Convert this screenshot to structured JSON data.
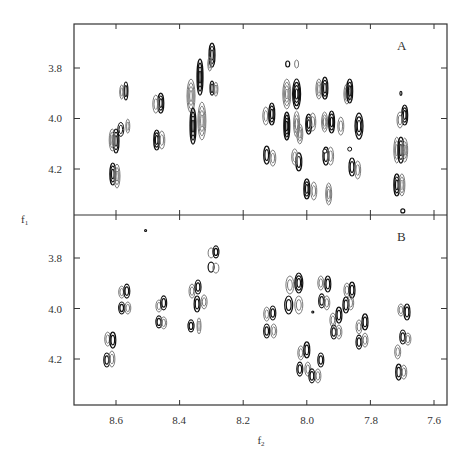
{
  "chart_data": {
    "type": "contour",
    "title": "",
    "xlabel": "f2",
    "ylabel": "f1",
    "x_ticks": [
      8.6,
      8.4,
      8.2,
      8.0,
      7.8,
      7.6
    ],
    "x_tick_labels": [
      "8.6",
      "8.4",
      "8.2",
      "8.0",
      "7.8",
      "7.6"
    ],
    "y_ticks": [
      3.8,
      4.0,
      4.2
    ],
    "y_tick_labels": [
      "3.8",
      "4.0",
      "4.2"
    ],
    "xlim": [
      8.732,
      7.559
    ],
    "ylim": [
      3.626,
      4.382
    ],
    "x_reversed": true,
    "y_reversed": true,
    "grid": false,
    "legend": "none",
    "colors": {
      "positive": "#111111",
      "negative": "#7a7a7a",
      "axis": "#333333"
    },
    "panels": [
      {
        "label": "A",
        "peaks": [
          {
            "f2": 8.569,
            "f1": 3.891,
            "w": 2,
            "h": 9,
            "c": "k"
          },
          {
            "f2": 8.582,
            "f1": 3.895,
            "w": 2,
            "h": 7,
            "c": "g"
          },
          {
            "f2": 8.585,
            "f1": 4.043,
            "w": 3,
            "h": 7,
            "c": "w"
          },
          {
            "f2": 8.6,
            "f1": 4.089,
            "w": 3,
            "h": 12,
            "c": "k"
          },
          {
            "f2": 8.612,
            "f1": 4.085,
            "w": 3,
            "h": 11,
            "c": "g"
          },
          {
            "f2": 8.563,
            "f1": 4.03,
            "w": 2,
            "h": 7,
            "c": "g"
          },
          {
            "f2": 8.61,
            "f1": 4.22,
            "w": 3,
            "h": 11,
            "c": "k"
          },
          {
            "f2": 8.597,
            "f1": 4.228,
            "w": 3,
            "h": 12,
            "c": "g"
          },
          {
            "f2": 8.459,
            "f1": 3.939,
            "w": 3,
            "h": 10,
            "c": "k"
          },
          {
            "f2": 8.475,
            "f1": 3.943,
            "w": 3,
            "h": 9,
            "c": "g"
          },
          {
            "f2": 8.472,
            "f1": 4.085,
            "w": 3,
            "h": 10,
            "c": "k"
          },
          {
            "f2": 8.456,
            "f1": 4.085,
            "w": 3,
            "h": 9,
            "c": "g"
          },
          {
            "f2": 8.298,
            "f1": 3.749,
            "w": 3,
            "h": 12,
            "c": "k"
          },
          {
            "f2": 8.305,
            "f1": 3.784,
            "w": 2,
            "h": 7,
            "c": "g"
          },
          {
            "f2": 8.298,
            "f1": 3.88,
            "w": 2,
            "h": 7,
            "c": "k"
          },
          {
            "f2": 8.286,
            "f1": 3.884,
            "w": 2,
            "h": 7,
            "c": "g"
          },
          {
            "f2": 8.364,
            "f1": 3.911,
            "w": 4,
            "h": 17,
            "c": "g"
          },
          {
            "f2": 8.336,
            "f1": 3.836,
            "w": 3,
            "h": 18,
            "c": "k"
          },
          {
            "f2": 8.358,
            "f1": 4.03,
            "w": 3,
            "h": 18,
            "c": "k"
          },
          {
            "f2": 8.33,
            "f1": 4.01,
            "w": 4,
            "h": 19,
            "c": "g"
          },
          {
            "f2": 8.06,
            "f1": 3.784,
            "w": 2,
            "h": 3,
            "c": "k"
          },
          {
            "f2": 8.032,
            "f1": 3.784,
            "w": 2,
            "h": 4,
            "c": "g"
          },
          {
            "f2": 8.063,
            "f1": 3.903,
            "w": 4,
            "h": 15,
            "c": "g"
          },
          {
            "f2": 8.032,
            "f1": 3.903,
            "w": 4,
            "h": 15,
            "c": "k"
          },
          {
            "f2": 7.962,
            "f1": 3.883,
            "w": 3,
            "h": 10,
            "c": "g"
          },
          {
            "f2": 7.943,
            "f1": 3.88,
            "w": 3,
            "h": 11,
            "c": "k"
          },
          {
            "f2": 7.874,
            "f1": 3.903,
            "w": 3,
            "h": 10,
            "c": "g"
          },
          {
            "f2": 7.865,
            "f1": 3.891,
            "w": 3,
            "h": 12,
            "c": "k"
          },
          {
            "f2": 8.129,
            "f1": 3.99,
            "w": 3,
            "h": 9,
            "c": "g"
          },
          {
            "f2": 8.11,
            "f1": 3.982,
            "w": 3,
            "h": 11,
            "c": "k"
          },
          {
            "f2": 8.063,
            "f1": 4.03,
            "w": 3,
            "h": 14,
            "c": "k"
          },
          {
            "f2": 8.032,
            "f1": 4.022,
            "w": 3,
            "h": 13,
            "c": "g"
          },
          {
            "f2": 8.022,
            "f1": 4.061,
            "w": 3,
            "h": 10,
            "c": "g"
          },
          {
            "f2": 7.994,
            "f1": 4.022,
            "w": 3,
            "h": 10,
            "c": "k"
          },
          {
            "f2": 7.981,
            "f1": 4.014,
            "w": 3,
            "h": 9,
            "c": "g"
          },
          {
            "f2": 7.944,
            "f1": 4.014,
            "w": 3,
            "h": 10,
            "c": "g"
          },
          {
            "f2": 7.922,
            "f1": 4.014,
            "w": 3,
            "h": 11,
            "c": "k"
          },
          {
            "f2": 7.893,
            "f1": 4.03,
            "w": 3,
            "h": 9,
            "c": "g"
          },
          {
            "f2": 7.836,
            "f1": 4.03,
            "w": 4,
            "h": 13,
            "c": "k"
          },
          {
            "f2": 8.126,
            "f1": 4.145,
            "w": 3,
            "h": 9,
            "c": "k"
          },
          {
            "f2": 8.107,
            "f1": 4.157,
            "w": 3,
            "h": 8,
            "c": "g"
          },
          {
            "f2": 8.025,
            "f1": 4.172,
            "w": 3,
            "h": 9,
            "c": "k"
          },
          {
            "f2": 8.038,
            "f1": 4.152,
            "w": 3,
            "h": 8,
            "c": "g"
          },
          {
            "f2": 7.94,
            "f1": 4.149,
            "w": 3,
            "h": 9,
            "c": "k"
          },
          {
            "f2": 7.925,
            "f1": 4.149,
            "w": 3,
            "h": 9,
            "c": "g"
          },
          {
            "f2": 7.943,
            "f1": 4.129,
            "w": 2,
            "h": 2,
            "c": "w"
          },
          {
            "f2": 7.858,
            "f1": 4.192,
            "w": 3,
            "h": 9,
            "c": "k"
          },
          {
            "f2": 7.84,
            "f1": 4.204,
            "w": 3,
            "h": 9,
            "c": "g"
          },
          {
            "f2": 7.865,
            "f1": 4.121,
            "w": 2,
            "h": 2,
            "c": "w"
          },
          {
            "f2": 8.0,
            "f1": 4.279,
            "w": 3,
            "h": 10,
            "c": "k"
          },
          {
            "f2": 7.978,
            "f1": 4.287,
            "w": 3,
            "h": 9,
            "c": "g"
          },
          {
            "f2": 7.931,
            "f1": 4.299,
            "w": 3,
            "h": 11,
            "c": "g"
          },
          {
            "f2": 7.704,
            "f1": 3.9,
            "w": 1,
            "h": 2,
            "c": "k"
          },
          {
            "f2": 7.692,
            "f1": 3.986,
            "w": 3,
            "h": 10,
            "c": "k"
          },
          {
            "f2": 7.707,
            "f1": 4.006,
            "w": 3,
            "h": 8,
            "c": "g"
          },
          {
            "f2": 7.717,
            "f1": 4.125,
            "w": 3,
            "h": 13,
            "c": "g"
          },
          {
            "f2": 7.704,
            "f1": 4.125,
            "w": 3,
            "h": 13,
            "c": "k"
          },
          {
            "f2": 7.692,
            "f1": 4.125,
            "w": 3,
            "h": 12,
            "c": "g"
          },
          {
            "f2": 7.717,
            "f1": 4.263,
            "w": 3,
            "h": 11,
            "c": "k"
          },
          {
            "f2": 7.701,
            "f1": 4.263,
            "w": 3,
            "h": 11,
            "c": "g"
          },
          {
            "f2": 7.698,
            "f1": 4.366,
            "w": 2,
            "h": 2,
            "c": "k"
          }
        ]
      },
      {
        "label": "B",
        "peaks": [
          {
            "f2": 8.507,
            "f1": 3.691,
            "w": 1,
            "h": 1,
            "c": "k"
          },
          {
            "f2": 8.301,
            "f1": 3.78,
            "w": 3,
            "h": 5,
            "c": "g"
          },
          {
            "f2": 8.286,
            "f1": 3.776,
            "w": 3,
            "h": 6,
            "c": "k"
          },
          {
            "f2": 8.301,
            "f1": 3.836,
            "w": 3,
            "h": 5,
            "c": "k"
          },
          {
            "f2": 8.286,
            "f1": 3.84,
            "w": 3,
            "h": 5,
            "c": "g"
          },
          {
            "f2": 8.582,
            "f1": 3.935,
            "w": 3,
            "h": 6,
            "c": "g"
          },
          {
            "f2": 8.566,
            "f1": 3.931,
            "w": 3,
            "h": 7,
            "c": "k"
          },
          {
            "f2": 8.582,
            "f1": 3.998,
            "w": 3,
            "h": 6,
            "c": "k"
          },
          {
            "f2": 8.563,
            "f1": 3.998,
            "w": 3,
            "h": 6,
            "c": "g"
          },
          {
            "f2": 8.465,
            "f1": 3.99,
            "w": 3,
            "h": 6,
            "c": "g"
          },
          {
            "f2": 8.45,
            "f1": 3.978,
            "w": 3,
            "h": 7,
            "c": "k"
          },
          {
            "f2": 8.465,
            "f1": 4.053,
            "w": 3,
            "h": 6,
            "c": "k"
          },
          {
            "f2": 8.45,
            "f1": 4.057,
            "w": 3,
            "h": 6,
            "c": "g"
          },
          {
            "f2": 8.361,
            "f1": 3.931,
            "w": 3,
            "h": 7,
            "c": "g"
          },
          {
            "f2": 8.342,
            "f1": 3.915,
            "w": 3,
            "h": 7,
            "c": "k"
          },
          {
            "f2": 8.345,
            "f1": 3.982,
            "w": 3,
            "h": 8,
            "c": "k"
          },
          {
            "f2": 8.323,
            "f1": 3.974,
            "w": 3,
            "h": 7,
            "c": "g"
          },
          {
            "f2": 8.364,
            "f1": 4.069,
            "w": 3,
            "h": 6,
            "c": "k"
          },
          {
            "f2": 8.339,
            "f1": 4.069,
            "w": 2,
            "h": 8,
            "c": "g"
          },
          {
            "f2": 8.626,
            "f1": 4.121,
            "w": 3,
            "h": 7,
            "c": "g"
          },
          {
            "f2": 8.61,
            "f1": 4.125,
            "w": 3,
            "h": 8,
            "c": "k"
          },
          {
            "f2": 8.629,
            "f1": 4.204,
            "w": 3,
            "h": 7,
            "c": "k"
          },
          {
            "f2": 8.613,
            "f1": 4.2,
            "w": 3,
            "h": 8,
            "c": "g"
          },
          {
            "f2": 8.053,
            "f1": 3.907,
            "w": 4,
            "h": 9,
            "c": "g"
          },
          {
            "f2": 8.025,
            "f1": 3.899,
            "w": 4,
            "h": 10,
            "c": "k"
          },
          {
            "f2": 8.057,
            "f1": 3.986,
            "w": 4,
            "h": 9,
            "c": "k"
          },
          {
            "f2": 8.025,
            "f1": 3.986,
            "w": 4,
            "h": 9,
            "c": "g"
          },
          {
            "f2": 7.956,
            "f1": 3.899,
            "w": 3,
            "h": 7,
            "c": "g"
          },
          {
            "f2": 7.934,
            "f1": 3.903,
            "w": 3,
            "h": 8,
            "c": "k"
          },
          {
            "f2": 7.953,
            "f1": 3.97,
            "w": 3,
            "h": 7,
            "c": "k"
          },
          {
            "f2": 7.937,
            "f1": 3.978,
            "w": 3,
            "h": 7,
            "c": "g"
          },
          {
            "f2": 7.874,
            "f1": 3.927,
            "w": 3,
            "h": 7,
            "c": "g"
          },
          {
            "f2": 7.858,
            "f1": 3.927,
            "w": 3,
            "h": 8,
            "c": "k"
          },
          {
            "f2": 7.877,
            "f1": 3.986,
            "w": 3,
            "h": 8,
            "c": "k"
          },
          {
            "f2": 7.862,
            "f1": 3.978,
            "w": 3,
            "h": 7,
            "c": "g"
          },
          {
            "f2": 8.126,
            "f1": 4.022,
            "w": 3,
            "h": 7,
            "c": "g"
          },
          {
            "f2": 8.107,
            "f1": 4.018,
            "w": 3,
            "h": 7,
            "c": "k"
          },
          {
            "f2": 8.126,
            "f1": 4.089,
            "w": 3,
            "h": 7,
            "c": "k"
          },
          {
            "f2": 8.104,
            "f1": 4.089,
            "w": 3,
            "h": 7,
            "c": "g"
          },
          {
            "f2": 7.918,
            "f1": 4.046,
            "w": 3,
            "h": 7,
            "c": "g"
          },
          {
            "f2": 7.899,
            "f1": 4.026,
            "w": 3,
            "h": 8,
            "c": "k"
          },
          {
            "f2": 7.915,
            "f1": 4.093,
            "w": 3,
            "h": 7,
            "c": "k"
          },
          {
            "f2": 7.899,
            "f1": 4.093,
            "w": 3,
            "h": 7,
            "c": "g"
          },
          {
            "f2": 7.836,
            "f1": 4.073,
            "w": 3,
            "h": 7,
            "c": "g"
          },
          {
            "f2": 7.817,
            "f1": 4.053,
            "w": 3,
            "h": 8,
            "c": "k"
          },
          {
            "f2": 7.836,
            "f1": 4.133,
            "w": 3,
            "h": 7,
            "c": "k"
          },
          {
            "f2": 7.817,
            "f1": 4.125,
            "w": 3,
            "h": 7,
            "c": "g"
          },
          {
            "f2": 8.019,
            "f1": 4.176,
            "w": 3,
            "h": 7,
            "c": "g"
          },
          {
            "f2": 8.0,
            "f1": 4.164,
            "w": 3,
            "h": 8,
            "c": "k"
          },
          {
            "f2": 7.956,
            "f1": 4.204,
            "w": 3,
            "h": 7,
            "c": "k"
          },
          {
            "f2": 8.022,
            "f1": 4.24,
            "w": 3,
            "h": 7,
            "c": "k"
          },
          {
            "f2": 7.997,
            "f1": 4.24,
            "w": 3,
            "h": 7,
            "c": "g"
          },
          {
            "f2": 7.984,
            "f1": 4.267,
            "w": 3,
            "h": 7,
            "c": "k"
          },
          {
            "f2": 7.965,
            "f1": 4.267,
            "w": 3,
            "h": 7,
            "c": "g"
          },
          {
            "f2": 7.981,
            "f1": 4.014,
            "w": 1,
            "h": 1,
            "c": "k"
          },
          {
            "f2": 7.704,
            "f1": 4.006,
            "w": 3,
            "h": 6,
            "c": "g"
          },
          {
            "f2": 7.685,
            "f1": 4.014,
            "w": 3,
            "h": 8,
            "c": "k"
          },
          {
            "f2": 7.698,
            "f1": 4.113,
            "w": 3,
            "h": 7,
            "c": "k"
          },
          {
            "f2": 7.682,
            "f1": 4.121,
            "w": 3,
            "h": 6,
            "c": "g"
          },
          {
            "f2": 7.714,
            "f1": 4.172,
            "w": 3,
            "h": 7,
            "c": "g"
          },
          {
            "f2": 7.711,
            "f1": 4.252,
            "w": 3,
            "h": 8,
            "c": "k"
          },
          {
            "f2": 7.695,
            "f1": 4.252,
            "w": 3,
            "h": 7,
            "c": "g"
          }
        ]
      }
    ]
  }
}
